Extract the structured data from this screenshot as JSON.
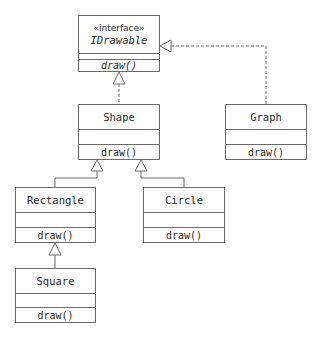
{
  "diagram": {
    "type": "UML class diagram",
    "classes": [
      {
        "id": "idrawable",
        "stereotype": "«interface»",
        "name": "IDrawable",
        "attributes": "",
        "operations": "draw()",
        "abstract": true
      },
      {
        "id": "shape",
        "name": "Shape",
        "attributes": "",
        "operations": "draw()"
      },
      {
        "id": "graph",
        "name": "Graph",
        "attributes": "",
        "operations": "draw()"
      },
      {
        "id": "rectangle",
        "name": "Rectangle",
        "attributes": "",
        "operations": "draw()"
      },
      {
        "id": "circle",
        "name": "Circle",
        "attributes": "",
        "operations": "draw()"
      },
      {
        "id": "square",
        "name": "Square",
        "attributes": "",
        "operations": "draw()"
      }
    ],
    "relationships": [
      {
        "from": "Shape",
        "to": "IDrawable",
        "kind": "realization"
      },
      {
        "from": "Graph",
        "to": "IDrawable",
        "kind": "realization"
      },
      {
        "from": "Rectangle",
        "to": "Shape",
        "kind": "generalization"
      },
      {
        "from": "Circle",
        "to": "Shape",
        "kind": "generalization"
      },
      {
        "from": "Square",
        "to": "Rectangle",
        "kind": "generalization"
      }
    ],
    "colors": {
      "line": "#6a6a6a",
      "text": "#2a2a2a",
      "background": "#ffffff"
    }
  }
}
